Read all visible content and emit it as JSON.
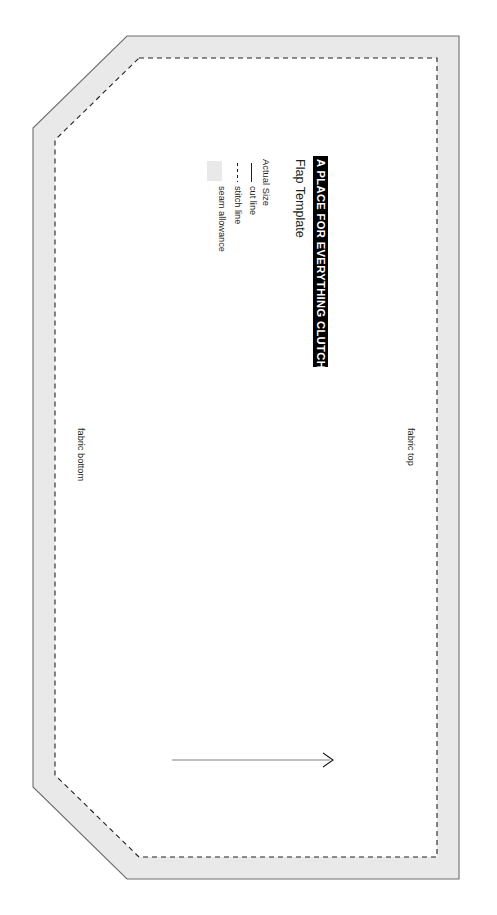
{
  "document": {
    "kind": "sewing-pattern-template",
    "title": "A PLACE FOR EVERYTHING CLUTCH",
    "subtitle": "Flap Template",
    "scale_note": "Actual Size"
  },
  "legend": {
    "items": [
      {
        "key": "cut",
        "label": "cut line",
        "sample": "solid-line",
        "color": "#231f20"
      },
      {
        "key": "stitch",
        "label": "stitch line",
        "sample": "dashed-line",
        "color": "#231f20"
      },
      {
        "key": "seam",
        "label": "seam allowance",
        "sample": "filled-swatch",
        "color": "#e9e9e9"
      }
    ]
  },
  "annotations": {
    "fabric_top": "fabric top",
    "fabric_bottom": "fabric bottom",
    "grainline": "grainline-arrow"
  },
  "colors": {
    "ink": "#231f20",
    "seam_allowance_fill": "#e9e9e9",
    "cut_line": "#58595b",
    "stitch_line": "#231f20",
    "paper": "#ffffff",
    "title_band": "#000000",
    "title_text": "#ffffff"
  },
  "geometry": {
    "cut_outline_points": "127,36 459,36 459,879 127,879 33,787 33,128",
    "stitch_outline_points": "139,58 437,58 437,857 139,857 55,775 55,140",
    "grainline": {
      "x1": 172,
      "y1": 760,
      "x2": 334,
      "y2": 760
    }
  }
}
